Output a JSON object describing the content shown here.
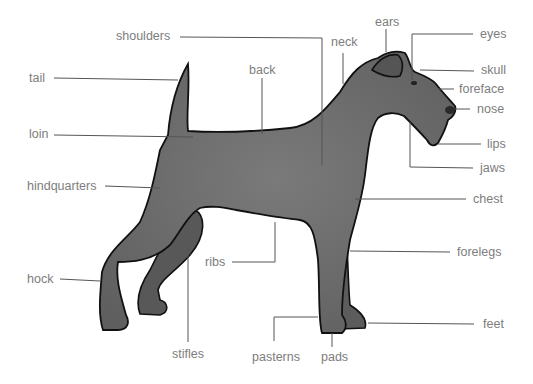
{
  "diagram": {
    "colors": {
      "body": "#6e6e6e",
      "outline": "#111111",
      "label_text": "#7d7d7d",
      "leader_line": "#555555",
      "background": "#ffffff"
    },
    "labels": [
      {
        "id": "shoulders",
        "text": "shoulders",
        "x": 116,
        "y": 29
      },
      {
        "id": "tail",
        "text": "tail",
        "x": 29,
        "y": 71
      },
      {
        "id": "back",
        "text": "back",
        "x": 249,
        "y": 63
      },
      {
        "id": "loin",
        "text": "loin",
        "x": 29,
        "y": 127
      },
      {
        "id": "hindquarters",
        "text": "hindquarters",
        "x": 27,
        "y": 179
      },
      {
        "id": "hock",
        "text": "hock",
        "x": 27,
        "y": 272
      },
      {
        "id": "ribs",
        "text": "ribs",
        "x": 205,
        "y": 255
      },
      {
        "id": "stifles",
        "text": "stifles",
        "x": 172,
        "y": 347
      },
      {
        "id": "pasterns",
        "text": "pasterns",
        "x": 252,
        "y": 350
      },
      {
        "id": "pads",
        "text": "pads",
        "x": 321,
        "y": 350
      },
      {
        "id": "ears",
        "text": "ears",
        "x": 375,
        "y": 15
      },
      {
        "id": "neck",
        "text": "neck",
        "x": 331,
        "y": 35
      },
      {
        "id": "eyes",
        "text": "eyes",
        "x": 480,
        "y": 27
      },
      {
        "id": "skull",
        "text": "skull",
        "x": 481,
        "y": 63
      },
      {
        "id": "foreface",
        "text": "foreface",
        "x": 459,
        "y": 82
      },
      {
        "id": "nose",
        "text": "nose",
        "x": 477,
        "y": 102
      },
      {
        "id": "lips",
        "text": "lips",
        "x": 487,
        "y": 137
      },
      {
        "id": "jaws",
        "text": "jaws",
        "x": 480,
        "y": 161
      },
      {
        "id": "chest",
        "text": "chest",
        "x": 473,
        "y": 192
      },
      {
        "id": "forelegs",
        "text": "forelegs",
        "x": 457,
        "y": 245
      },
      {
        "id": "feet",
        "text": "feet",
        "x": 483,
        "y": 317
      }
    ]
  }
}
